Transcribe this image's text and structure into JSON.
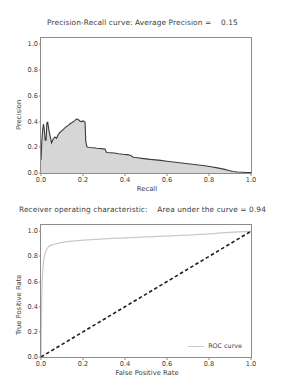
{
  "figure": {
    "background": "#ffffff",
    "axis_color": "#8c8c8c",
    "text_color": "#404040"
  },
  "charts": [
    {
      "id": "precision-recall",
      "title": "Precision-Recall curve: Average Precision =    0.15",
      "xlabel": "Recall",
      "ylabel": "Precision"
    },
    {
      "id": "roc",
      "title": "Receiver operating characteristic:    Area under the curve = 0.94",
      "xlabel": "False Positive Rate",
      "ylabel": "True Positive Rate",
      "legend": {
        "roc_curve": "ROC curve"
      }
    }
  ],
  "ticks": {
    "pr_x": [
      "0.0",
      "0.2",
      "0.4",
      "0.6",
      "0.8",
      "1.0"
    ],
    "pr_y": [
      "0.0",
      "0.2",
      "0.4",
      "0.6",
      "0.8",
      "1.0"
    ],
    "roc_x": [
      "0.0",
      "0.2",
      "0.4",
      "0.6",
      "0.8",
      "1.0"
    ],
    "roc_y": [
      "0.0",
      "0.2",
      "0.4",
      "0.6",
      "0.8",
      "1.0"
    ]
  },
  "chart_data": [
    {
      "type": "area",
      "id": "precision-recall",
      "title": "Precision-Recall curve: Average Precision =    0.15",
      "xlabel": "Recall",
      "ylabel": "Precision",
      "xlim": [
        0.0,
        1.0
      ],
      "ylim": [
        0.0,
        1.05
      ],
      "xticks": [
        0.0,
        0.2,
        0.4,
        0.6,
        0.8,
        1.0
      ],
      "yticks": [
        0.0,
        0.2,
        0.4,
        0.6,
        0.8,
        1.0
      ],
      "grid": false,
      "legend": null,
      "annotations": [
        {
          "text": "Average Precision = 0.15",
          "location": "title"
        }
      ],
      "fill_color": "#d6d6d6",
      "line_color": "#3c3c3c",
      "series": [
        {
          "name": "Precision-Recall",
          "x": [
            0.0,
            0.004,
            0.008,
            0.012,
            0.016,
            0.02,
            0.024,
            0.028,
            0.032,
            0.038,
            0.044,
            0.05,
            0.058,
            0.066,
            0.074,
            0.082,
            0.09,
            0.1,
            0.11,
            0.12,
            0.13,
            0.14,
            0.15,
            0.16,
            0.168,
            0.176,
            0.184,
            0.192,
            0.2,
            0.206,
            0.21,
            0.213,
            0.218,
            0.225,
            0.235,
            0.25,
            0.265,
            0.28,
            0.295,
            0.305,
            0.312,
            0.33,
            0.35,
            0.37,
            0.39,
            0.41,
            0.425,
            0.44,
            0.46,
            0.48,
            0.5,
            0.52,
            0.545,
            0.57,
            0.6,
            0.63,
            0.66,
            0.69,
            0.72,
            0.75,
            0.78,
            0.81,
            0.84,
            0.87,
            0.895,
            0.915,
            0.935,
            0.96,
            0.985,
            1.0
          ],
          "y": [
            0.1,
            0.25,
            0.34,
            0.38,
            0.33,
            0.255,
            0.255,
            0.39,
            0.395,
            0.33,
            0.285,
            0.235,
            0.265,
            0.28,
            0.27,
            0.3,
            0.315,
            0.33,
            0.345,
            0.36,
            0.37,
            0.385,
            0.395,
            0.405,
            0.42,
            0.418,
            0.405,
            0.4,
            0.405,
            0.4,
            0.395,
            0.25,
            0.205,
            0.2,
            0.198,
            0.196,
            0.192,
            0.19,
            0.188,
            0.186,
            0.16,
            0.158,
            0.155,
            0.15,
            0.146,
            0.143,
            0.138,
            0.122,
            0.118,
            0.114,
            0.11,
            0.106,
            0.102,
            0.098,
            0.092,
            0.086,
            0.08,
            0.074,
            0.068,
            0.062,
            0.056,
            0.048,
            0.04,
            0.03,
            0.02,
            0.012,
            0.008,
            0.006,
            0.004,
            0.003
          ]
        }
      ]
    },
    {
      "type": "line",
      "id": "roc",
      "title": "Receiver operating characteristic:    Area under the curve = 0.94",
      "xlabel": "False Positive Rate",
      "ylabel": "True Positive Rate",
      "xlim": [
        0.0,
        1.0
      ],
      "ylim": [
        0.0,
        1.05
      ],
      "xticks": [
        0.0,
        0.2,
        0.4,
        0.6,
        0.8,
        1.0
      ],
      "yticks": [
        0.0,
        0.2,
        0.4,
        0.6,
        0.8,
        1.0
      ],
      "grid": false,
      "legend_position": "lower right",
      "annotations": [
        {
          "text": "Area under the curve = 0.94",
          "location": "title"
        }
      ],
      "series": [
        {
          "name": "ROC curve",
          "color": "#c9c9c9",
          "style": "solid",
          "x": [
            0.0,
            0.002,
            0.004,
            0.006,
            0.009,
            0.012,
            0.016,
            0.02,
            0.026,
            0.032,
            0.04,
            0.05,
            0.062,
            0.075,
            0.09,
            0.11,
            0.135,
            0.16,
            0.19,
            0.22,
            0.26,
            0.3,
            0.34,
            0.38,
            0.42,
            0.46,
            0.5,
            0.54,
            0.58,
            0.62,
            0.66,
            0.7,
            0.74,
            0.78,
            0.82,
            0.86,
            0.9,
            0.94,
            0.97,
            1.0
          ],
          "y": [
            0.0,
            0.3,
            0.52,
            0.62,
            0.7,
            0.76,
            0.8,
            0.83,
            0.855,
            0.87,
            0.882,
            0.89,
            0.897,
            0.902,
            0.908,
            0.914,
            0.92,
            0.924,
            0.928,
            0.932,
            0.936,
            0.94,
            0.943,
            0.946,
            0.949,
            0.952,
            0.955,
            0.958,
            0.961,
            0.964,
            0.967,
            0.97,
            0.974,
            0.978,
            0.982,
            0.987,
            0.992,
            0.996,
            0.998,
            1.0
          ]
        },
        {
          "name": "chance",
          "color": "#1c1c33",
          "style": "dashed",
          "x": [
            0.0,
            1.0
          ],
          "y": [
            0.0,
            1.0
          ]
        }
      ]
    }
  ]
}
